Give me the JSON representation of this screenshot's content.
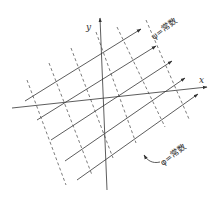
{
  "diagram": {
    "type": "flow-net",
    "axes": {
      "x_label": "x",
      "y_label": "y"
    },
    "labels": {
      "stream_const": "ψ=常数",
      "potential_const": "φ=常数"
    },
    "colors": {
      "line": "#333333",
      "background": "#ffffff"
    }
  }
}
